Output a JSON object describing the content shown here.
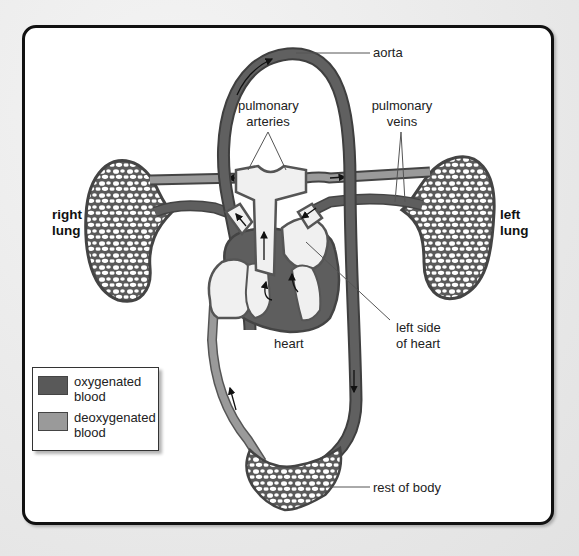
{
  "diagram": {
    "labels": {
      "aorta": "aorta",
      "pulmonary_arteries_line1": "pulmonary",
      "pulmonary_arteries_line2": "arteries",
      "pulmonary_veins_line1": "pulmonary",
      "pulmonary_veins_line2": "veins",
      "right_lung_line1": "right",
      "right_lung_line2": "lung",
      "left_lung_line1": "left",
      "left_lung_line2": "lung",
      "heart": "heart",
      "left_side_line1": "left side",
      "left_side_line2": "of heart",
      "rest_of_body": "rest of body"
    },
    "legend": {
      "items": [
        {
          "label_line1": "oxygenated",
          "label_line2": "blood",
          "color": "#595959"
        },
        {
          "label_line1": "deoxygenated",
          "label_line2": "blood",
          "color": "#9a9a9a"
        }
      ]
    },
    "colors": {
      "oxygenated": "#595959",
      "deoxygenated": "#9a9a9a",
      "heart_chamber": "#f0f0f0",
      "outline": "#4a4a4a",
      "panel_border": "#111111"
    }
  }
}
